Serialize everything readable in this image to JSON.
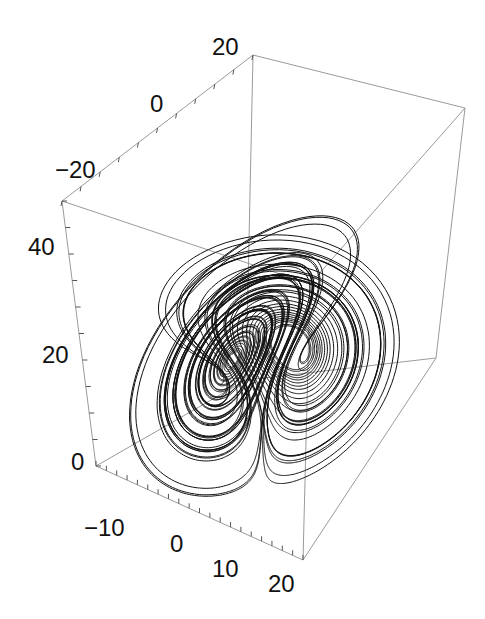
{
  "chart_data": {
    "type": "line",
    "subtype": "3d-parametric-curve",
    "title": "",
    "system": {
      "name": "Lorenz",
      "sigma": 10,
      "rho": 28,
      "beta": 2.6667
    },
    "axes": {
      "x": {
        "label": "",
        "range": [
          -20,
          20
        ],
        "ticks": [
          -10,
          0,
          10,
          20
        ],
        "tick_labels": [
          "−10",
          "0",
          "10",
          "20"
        ]
      },
      "y": {
        "label": "",
        "range": [
          -30,
          20
        ],
        "ticks": [
          -20,
          0,
          20
        ],
        "tick_labels": [
          "−20",
          "0",
          "20"
        ]
      },
      "z": {
        "label": "",
        "range": [
          0,
          50
        ],
        "ticks": [
          0,
          20,
          40
        ],
        "tick_labels": [
          "0",
          "20",
          "40"
        ]
      }
    },
    "grid": false,
    "legend": null,
    "series": [
      {
        "name": "trajectory",
        "color": "#111111"
      }
    ],
    "box_color": "#9a9a9a"
  },
  "labels": {
    "y_axis": [
      {
        "text": "20",
        "x": 212,
        "y": 55
      },
      {
        "text": "0",
        "x": 150,
        "y": 112
      },
      {
        "text": "−20",
        "x": 55,
        "y": 178
      }
    ],
    "z_axis": [
      {
        "text": "40",
        "x": 28,
        "y": 255
      },
      {
        "text": "20",
        "x": 42,
        "y": 363
      },
      {
        "text": "0",
        "x": 71,
        "y": 470
      }
    ],
    "x_axis": [
      {
        "text": "−10",
        "x": 84,
        "y": 536
      },
      {
        "text": "0",
        "x": 170,
        "y": 552
      },
      {
        "text": "10",
        "x": 212,
        "y": 577
      },
      {
        "text": "20",
        "x": 268,
        "y": 592
      }
    ]
  }
}
